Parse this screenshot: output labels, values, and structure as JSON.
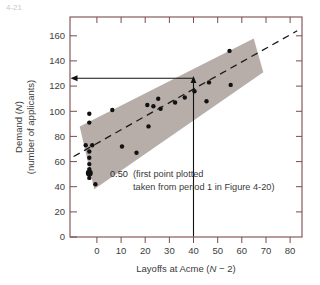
{
  "figure": {
    "corner_mark": "4-21",
    "background_color": "#ffffff",
    "frame_color": "#7a4c4c",
    "band_color": "#b3aaa5",
    "point_color": "#111111",
    "line_color": "#1a1a1a"
  },
  "chart_data": {
    "type": "scatter",
    "title": "",
    "xlabel": "Layoffs at Acme (N − 2)",
    "xlabel_parts": {
      "pre": "Layoffs at Acme (",
      "italic": "N",
      "post": " − 2)"
    },
    "ylabel_line1": "Demand (N)",
    "ylabel_line1_parts": {
      "pre": "Demand (",
      "italic": "N",
      "post": ")"
    },
    "ylabel_line2": "(number of applicants)",
    "xlim": [
      -8,
      88
    ],
    "ylim": [
      0,
      175
    ],
    "xticks": [
      0,
      10,
      20,
      30,
      40,
      50,
      60,
      70,
      80
    ],
    "yticks": [
      0,
      20,
      40,
      60,
      80,
      100,
      120,
      140,
      160
    ],
    "xtick_labels": [
      "0",
      "10",
      "20",
      "30",
      "40",
      "50",
      "60",
      "70",
      "80"
    ],
    "ytick_labels": [
      "0",
      "20",
      "40",
      "60",
      "80",
      "100",
      "120",
      "140",
      "160"
    ],
    "grid": false,
    "legend": "none",
    "points": [
      {
        "x": 0,
        "y": 98
      },
      {
        "x": 0,
        "y": 91
      },
      {
        "x": -1.5,
        "y": 73
      },
      {
        "x": 1.2,
        "y": 73
      },
      {
        "x": 0,
        "y": 68
      },
      {
        "x": 0,
        "y": 63
      },
      {
        "x": 0,
        "y": 58
      },
      {
        "x": 0,
        "y": 54
      },
      {
        "x": 0,
        "y": 47
      },
      {
        "x": 2.5,
        "y": 42
      },
      {
        "x": 9.5,
        "y": 101
      },
      {
        "x": 13.5,
        "y": 72
      },
      {
        "x": 19.5,
        "y": 67
      },
      {
        "x": 24.5,
        "y": 88
      },
      {
        "x": 24.0,
        "y": 105
      },
      {
        "x": 26.5,
        "y": 104
      },
      {
        "x": 28.5,
        "y": 110
      },
      {
        "x": 29.5,
        "y": 102
      },
      {
        "x": 35.5,
        "y": 107
      },
      {
        "x": 39.5,
        "y": 111
      },
      {
        "x": 43.5,
        "y": 116
      },
      {
        "x": 48.5,
        "y": 108
      },
      {
        "x": 49.5,
        "y": 123
      },
      {
        "x": 58.0,
        "y": 148
      },
      {
        "x": 58.5,
        "y": 121
      }
    ],
    "highlight_point": {
      "x": 0,
      "y": 51,
      "label": "0.50"
    },
    "trend_line": {
      "style": "dashed",
      "x1": -6.5,
      "y1": 64,
      "x2": 86,
      "y2": 164
    },
    "band": {
      "style": "shaded-confidence-band",
      "corners": [
        {
          "x": -4.0,
          "y": 88
        },
        {
          "x": 68.0,
          "y": 158
        },
        {
          "x": 72.0,
          "y": 131
        },
        {
          "x": 2.0,
          "y": 38
        }
      ]
    },
    "reader_lines": {
      "vertical_from_x": 50,
      "horizontal_to_y": 126,
      "arrow_left": true,
      "arrow_up": true
    },
    "annotation": {
      "value": "0.50",
      "line1": "(first point plotted",
      "line2": "taken from period 1 in Figure 4-20)",
      "marker_bullet": "•"
    }
  }
}
